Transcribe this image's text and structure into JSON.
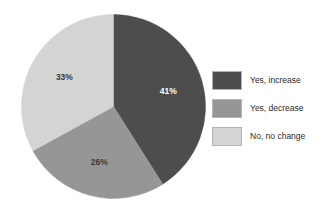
{
  "chart_data": {
    "type": "pie",
    "title": "",
    "subtitle": "",
    "xlabel": "",
    "ylabel": "",
    "grid": false,
    "legend_position": "right",
    "start_angle_deg": 0,
    "direction": "clockwise",
    "categories": [
      "Yes, increase",
      "Yes, decrease",
      "No, no change"
    ],
    "values": [
      41,
      26,
      33
    ],
    "value_unit": "%",
    "slices": [
      {
        "label": "Yes, increase",
        "value": 41,
        "data_label": "41%",
        "color": "#4d4d4d",
        "label_color": "#ffffff"
      },
      {
        "label": "Yes, decrease",
        "value": 26,
        "data_label": "26%",
        "color": "#969696",
        "label_color": "#3a3a3a"
      },
      {
        "label": "No, no change",
        "value": 33,
        "data_label": "33%",
        "color": "#d4d4d4",
        "label_color": "#3a3a3a"
      }
    ]
  },
  "legend": {
    "items": [
      {
        "label": "Yes, increase",
        "color": "#4d4d4d"
      },
      {
        "label": "Yes, decrease",
        "color": "#969696"
      },
      {
        "label": "No, no change",
        "color": "#d4d4d4"
      }
    ]
  },
  "colors": {
    "background": "#ffffff",
    "slice_dark": "#4d4d4d",
    "slice_medium": "#969696",
    "slice_light": "#d4d4d4",
    "swatch_border": "#b4b4b4",
    "text": "#2b2b2b"
  }
}
